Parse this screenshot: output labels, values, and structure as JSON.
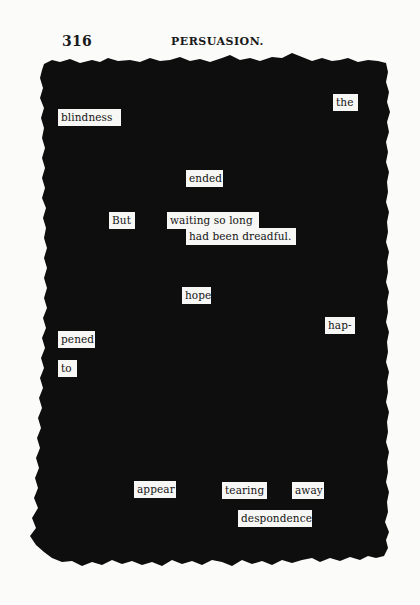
{
  "page": {
    "page_number": "316",
    "running_title": "PERSUASION.",
    "background_color": "#fbfbfa",
    "blackout_color": "#0e0e0e"
  },
  "words": [
    {
      "text": "the",
      "x": 333,
      "y": 94,
      "w": 25
    },
    {
      "text": "blindness",
      "x": 58,
      "y": 109,
      "w": 63
    },
    {
      "text": "ended",
      "x": 186,
      "y": 170,
      "w": 37
    },
    {
      "text": "But",
      "x": 109,
      "y": 212,
      "w": 26
    },
    {
      "text": "waiting so long",
      "x": 167,
      "y": 212,
      "w": 92
    },
    {
      "text": "had been dreadful.",
      "x": 186,
      "y": 228,
      "w": 110
    },
    {
      "text": "hope",
      "x": 182,
      "y": 287,
      "w": 29
    },
    {
      "text": "hap-",
      "x": 325,
      "y": 317,
      "w": 30
    },
    {
      "text": "pened",
      "x": 58,
      "y": 331,
      "w": 37
    },
    {
      "text": "to",
      "x": 58,
      "y": 360,
      "w": 19
    },
    {
      "text": "appear",
      "x": 134,
      "y": 481,
      "w": 42
    },
    {
      "text": "tearing",
      "x": 222,
      "y": 482,
      "w": 45
    },
    {
      "text": "away",
      "x": 292,
      "y": 482,
      "w": 32
    },
    {
      "text": "despondence",
      "x": 238,
      "y": 510,
      "w": 74
    }
  ]
}
